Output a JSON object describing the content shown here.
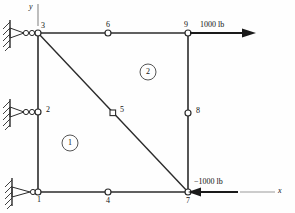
{
  "figure": {
    "type": "finite-element-mesh"
  },
  "axes": {
    "y_label": "y",
    "x_label": "x"
  },
  "nodes": [
    {
      "id": "1",
      "label": "1",
      "x": 38,
      "y": 192,
      "marker": "circle",
      "label_pos": "below-right"
    },
    {
      "id": "2",
      "label": "2",
      "x": 38,
      "y": 112,
      "marker": "circle",
      "label_pos": "right"
    },
    {
      "id": "3",
      "label": "3",
      "x": 38,
      "y": 33,
      "marker": "circle",
      "label_pos": "above-right"
    },
    {
      "id": "4",
      "label": "4",
      "x": 108,
      "y": 192,
      "marker": "circle",
      "label_pos": "below"
    },
    {
      "id": "5",
      "label": "5",
      "x": 113,
      "y": 113,
      "marker": "square",
      "label_pos": "right"
    },
    {
      "id": "6",
      "label": "6",
      "x": 108,
      "y": 33,
      "marker": "circle",
      "label_pos": "above"
    },
    {
      "id": "7",
      "label": "7",
      "x": 188,
      "y": 192,
      "marker": "circle",
      "label_pos": "below"
    },
    {
      "id": "8",
      "label": "8",
      "x": 188,
      "y": 113,
      "marker": "circle",
      "label_pos": "right"
    },
    {
      "id": "9",
      "label": "9",
      "x": 188,
      "y": 33,
      "marker": "circle",
      "label_pos": "above-left"
    }
  ],
  "elements": [
    {
      "id": "1",
      "label": "1",
      "cx": 70,
      "cy": 143
    },
    {
      "id": "2",
      "label": "2",
      "cx": 148,
      "cy": 72
    }
  ],
  "supports": [
    {
      "node": "3",
      "x": 38,
      "y": 33,
      "type": "roller-wall"
    },
    {
      "node": "2",
      "x": 38,
      "y": 112,
      "type": "roller-wall"
    },
    {
      "node": "1",
      "x": 38,
      "y": 192,
      "type": "pin-wall"
    }
  ],
  "loads": [
    {
      "id": "load-top",
      "label": "1000 lb",
      "node": "9",
      "direction": "right",
      "x": 188,
      "y": 33
    },
    {
      "id": "load-bottom",
      "label": "−1000 lb",
      "node": "7",
      "direction": "left",
      "x": 188,
      "y": 192
    }
  ],
  "colors": {
    "line": "#2b2b2b",
    "text": "#111111",
    "arrow": "#1a1a1a",
    "axis": "#9a9a9a",
    "node_fill": "#ffffff"
  }
}
